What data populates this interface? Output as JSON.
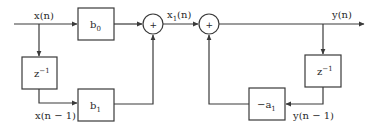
{
  "diagram": {
    "type": "block-diagram",
    "title": "",
    "signals": {
      "input": "x(n)",
      "input_delayed": "x(n − 1)",
      "intermediate": {
        "base": "x",
        "sub": "1",
        "rest": "(n)"
      },
      "output": "y(n)",
      "output_delayed": "y(n − 1)"
    },
    "blocks": {
      "b0": {
        "base": "b",
        "sub": "0"
      },
      "b1": {
        "base": "b",
        "sub": "1"
      },
      "delay_left": {
        "base": "z",
        "sup": "−1"
      },
      "delay_right": {
        "base": "z",
        "sup": "−1"
      },
      "neg_a1": {
        "base": "−a",
        "sub": "1"
      }
    },
    "adders": {
      "adder1": "+",
      "adder2": "+"
    },
    "colors": {
      "line": "#3a3a3a",
      "text": "#2a2a2a",
      "background": "#ffffff"
    }
  }
}
